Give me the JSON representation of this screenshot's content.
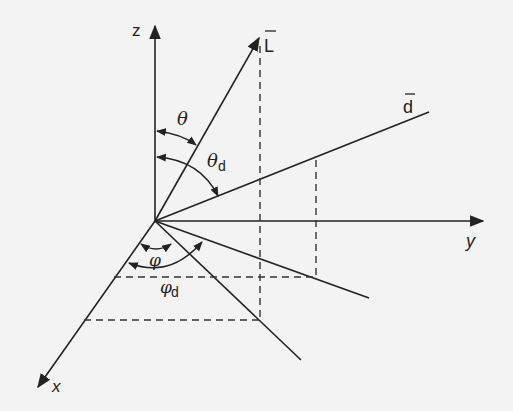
{
  "diagram": {
    "axes": {
      "z": "z",
      "y": "y",
      "x": "x"
    },
    "vectors": {
      "L": "L",
      "d": "d"
    },
    "angles": {
      "theta": "θ",
      "theta_d_base": "θ",
      "theta_d_sub": "d",
      "phi": "φ",
      "phi_d_base": "φ",
      "phi_d_sub": "d"
    },
    "colors": {
      "line": "#222222",
      "background": "#f3f3f3"
    }
  }
}
